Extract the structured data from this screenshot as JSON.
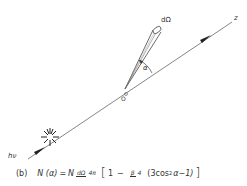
{
  "figure": {
    "axis_label": "z",
    "origin_label": "O",
    "solid_angle_label": "dΩ",
    "angle_label": "α",
    "photon_label": "hν",
    "line_color": "#555555"
  },
  "formula": {
    "panel": "(b)",
    "lhs": "N (α)",
    "equals": "=",
    "coef": "N",
    "frac1_num": "dΩ",
    "frac1_den": "4π",
    "open_bracket": "[",
    "one": "1",
    "minus": "−",
    "frac2_num": "β",
    "frac2_den": "4",
    "paren_expr_a": "(3cos",
    "exponent": "2",
    "paren_expr_b": "α−1)",
    "close_bracket": "]"
  }
}
